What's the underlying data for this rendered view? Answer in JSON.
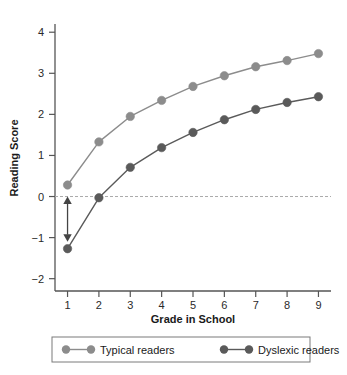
{
  "chart_data": {
    "type": "line",
    "title": "",
    "xlabel": "Grade in School",
    "ylabel": "Reading Score",
    "x": [
      1,
      2,
      3,
      4,
      5,
      6,
      7,
      8,
      9
    ],
    "xticklabels": [
      "1",
      "2",
      "3",
      "4",
      "5",
      "6",
      "7",
      "8",
      "9"
    ],
    "yticklabels": [
      "4",
      "3",
      "2",
      "1",
      "0",
      "−1",
      "−2"
    ],
    "yticks": [
      4,
      3,
      2,
      1,
      0,
      -1,
      -2
    ],
    "xlim": [
      0.6,
      9.4
    ],
    "ylim": [
      -2.3,
      4.2
    ],
    "grid": false,
    "legend_position": "bottom",
    "series": [
      {
        "name": "Typical readers",
        "color": "#8c8c8c",
        "marker": "circle",
        "values": [
          0.28,
          1.33,
          1.95,
          2.34,
          2.68,
          2.94,
          3.16,
          3.31,
          3.48
        ]
      },
      {
        "name": "Dyslexic readers",
        "color": "#5a5a5a",
        "marker": "circle",
        "values": [
          -1.27,
          -0.03,
          0.71,
          1.19,
          1.56,
          1.87,
          2.12,
          2.29,
          2.43
        ]
      }
    ],
    "reference_line": {
      "name": "zero-line",
      "value": 0,
      "style": "dashed",
      "color": "#aaaaaa"
    },
    "annotations": [
      {
        "name": "gap-arrow",
        "type": "double-headed-arrow",
        "x": 1,
        "y_from": 0,
        "y_to": -1.1,
        "color": "#444444",
        "label": ""
      }
    ]
  },
  "legend": {
    "items": [
      {
        "label": "Typical readers",
        "color": "#8c8c8c"
      },
      {
        "label": "Dyslexic readers",
        "color": "#5a5a5a"
      }
    ]
  }
}
